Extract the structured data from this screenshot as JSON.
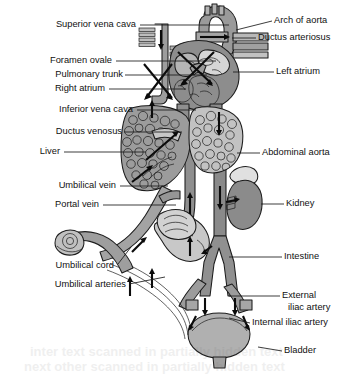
{
  "figure": {
    "type": "anatomical-diagram",
    "background_color": "#ffffff",
    "ink_color": "#1c1c1c",
    "palette": {
      "vessel_mid_gray": "#8f8f8f",
      "vessel_light_gray": "#c9c9c9",
      "organ_dark_gray": "#7a7a7a",
      "organ_mid_gray": "#a8a8a8",
      "organ_light_gray": "#d8d8d8",
      "heart_gray": "#9a9a9a",
      "white": "#f4f4f4"
    }
  },
  "labels_left": [
    {
      "id": "superior-vena-cava",
      "text": "Superior vena cava",
      "text_x": 136,
      "text_y": 25,
      "leader": "M140,25 L229,25"
    },
    {
      "id": "foramen-ovale",
      "text": "Foramen ovale",
      "text_x": 112,
      "text_y": 61,
      "leader": "M116,61 L216,61"
    },
    {
      "id": "pulmonary-trunk",
      "text": "Pulmonary trunk",
      "text_x": 123,
      "text_y": 75,
      "leader": "M125,75 L207,75"
    },
    {
      "id": "right-atrium",
      "text": "Right atrium",
      "text_x": 105,
      "text_y": 89,
      "leader": "M109,89 L186,89"
    },
    {
      "id": "inferior-vena-cava",
      "text": "Inferior vena cava",
      "text_x": 133,
      "text_y": 110,
      "leader": "M137,110 L196,110"
    },
    {
      "id": "ductus-venosus",
      "text": "Ductus venosus",
      "text_x": 122,
      "text_y": 132,
      "leader": "M124,132 L182,132"
    },
    {
      "id": "liver",
      "text": "Liver",
      "text_x": 60,
      "text_y": 152,
      "leader": "M64,152 L146,152"
    },
    {
      "id": "umbilical-vein",
      "text": "Umbilical vein",
      "text_x": 116,
      "text_y": 186,
      "leader": "M120,186 L168,186"
    },
    {
      "id": "portal-vein",
      "text": "Portal vein",
      "text_x": 99,
      "text_y": 205,
      "leader": "M103,205 L176,205"
    },
    {
      "id": "umbilical-cord",
      "text": "Umbilical cord",
      "text_x": 114,
      "text_y": 266,
      "leader": "M118,264 L131,247"
    },
    {
      "id": "umbilical-arteries",
      "text": "Umbilical arteries",
      "text_x": 126,
      "text_y": 285,
      "leader": "M129,284 L165,277"
    }
  ],
  "labels_right": [
    {
      "id": "arch-of-aorta",
      "text": "Arch of aorta",
      "text_x": 274,
      "text_y": 21,
      "leader": "M272,21 L236,30"
    },
    {
      "id": "ductus-arteriosus",
      "text": "Ductus arteriosus",
      "text_x": 258,
      "text_y": 38,
      "leader": "M256,38 L232,38"
    },
    {
      "id": "left-atrium",
      "text": "Left atrium",
      "text_x": 276,
      "text_y": 72,
      "leader": "M274,72 L233,72"
    },
    {
      "id": "abdominal-aorta",
      "text": "Abdominal aorta",
      "text_x": 262,
      "text_y": 153,
      "leader": "M260,153 L237,153"
    },
    {
      "id": "kidney",
      "text": "Kidney",
      "text_x": 286,
      "text_y": 204,
      "leader": "M284,204 L261,204"
    },
    {
      "id": "intestine",
      "text": "Intestine",
      "text_x": 284,
      "text_y": 257,
      "leader": "M282,257 L229,257"
    },
    {
      "id": "external-iliac-artery",
      "text": "External",
      "text_x": 282,
      "text_y": 296,
      "leader": "M280,296 L229,296"
    },
    {
      "id": "external-iliac-artery-l2",
      "text": "iliac artery",
      "text_x": 288,
      "text_y": 308,
      "leader": ""
    },
    {
      "id": "internal-iliac-artery",
      "text": "Internal iliac artery",
      "text_x": 252,
      "text_y": 323,
      "leader": "M250,323 L229,318"
    },
    {
      "id": "bladder",
      "text": "Bladder",
      "text_x": 284,
      "text_y": 351,
      "leader": "M282,351 L258,347"
    }
  ],
  "structures": [
    {
      "id": "heart",
      "name": "Heart with four chambers"
    },
    {
      "id": "aortic-arch",
      "name": "Arch of aorta"
    },
    {
      "id": "ductus-arteriosus",
      "name": "Ductus arteriosus"
    },
    {
      "id": "superior-vena-cava",
      "name": "Superior vena cava"
    },
    {
      "id": "inferior-vena-cava",
      "name": "Inferior vena cava"
    },
    {
      "id": "liver",
      "name": "Liver"
    },
    {
      "id": "ductus-venosus",
      "name": "Ductus venosus"
    },
    {
      "id": "portal-vein",
      "name": "Portal vein"
    },
    {
      "id": "umbilical-vein",
      "name": "Umbilical vein"
    },
    {
      "id": "umbilical-arteries",
      "name": "Umbilical arteries"
    },
    {
      "id": "umbilical-cord",
      "name": "Umbilical cord"
    },
    {
      "id": "abdominal-aorta",
      "name": "Abdominal aorta"
    },
    {
      "id": "kidney",
      "name": "Kidney with adrenal gland"
    },
    {
      "id": "intestine",
      "name": "Intestine"
    },
    {
      "id": "stomach",
      "name": "Stomach"
    },
    {
      "id": "bladder",
      "name": "Bladder"
    },
    {
      "id": "iliac-arteries",
      "name": "External and internal iliac arteries"
    }
  ],
  "flow_arrows": {
    "count": 22,
    "description": "Black directional arrows indicating blood flow through fetal shunts"
  },
  "page_artifacts": {
    "bleed_text_line1": "inter text scanned  in  partially  hidden  text",
    "bleed_text_line2": "next other scanned  in  partially  hidden  text"
  }
}
